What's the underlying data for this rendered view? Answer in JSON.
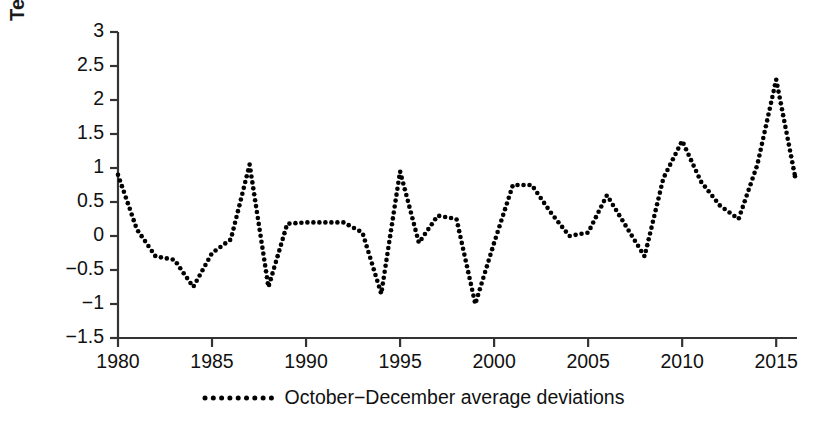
{
  "chart_data": {
    "type": "line",
    "style": "dotted",
    "title": "",
    "xlabel": "",
    "ylabel": "Temperature (°F)",
    "xlim": [
      1980,
      2016
    ],
    "ylim": [
      -1.5,
      3
    ],
    "grid": false,
    "legend_position": "bottom-center",
    "x_ticks": [
      1980,
      1985,
      1990,
      1995,
      2000,
      2005,
      2010,
      2015
    ],
    "x_tick_labels": [
      "1980",
      "1985",
      "1990",
      "1995",
      "2000",
      "2005",
      "2010",
      "2015"
    ],
    "y_ticks": [
      3,
      2.5,
      2,
      1.5,
      1,
      0.5,
      0,
      -0.5,
      -1,
      -1.5
    ],
    "y_tick_labels": [
      "3",
      "2.5",
      "2",
      "1.5",
      "1",
      "0.5",
      "0",
      "−0.5",
      "−1",
      "−1.5"
    ],
    "series": [
      {
        "name": "October−December average deviations",
        "color": "#000000",
        "x": [
          1980,
          1981,
          1982,
          1983,
          1984,
          1985,
          1986,
          1987,
          1988,
          1989,
          1990,
          1991,
          1992,
          1993,
          1994,
          1995,
          1996,
          1997,
          1998,
          1999,
          2000,
          2001,
          2002,
          2003,
          2004,
          2005,
          2006,
          2007,
          2008,
          2009,
          2010,
          2011,
          2012,
          2013,
          2014,
          2015,
          2016
        ],
        "values": [
          0.9,
          0.1,
          -0.3,
          -0.35,
          -0.75,
          -0.25,
          -0.05,
          1.05,
          -0.75,
          0.18,
          0.2,
          0.2,
          0.2,
          0.05,
          -0.85,
          0.95,
          -0.1,
          0.3,
          0.25,
          -1.0,
          -0.1,
          0.75,
          0.75,
          0.35,
          0.0,
          0.05,
          0.6,
          0.15,
          -0.3,
          0.85,
          1.4,
          0.8,
          0.45,
          0.25,
          1.05,
          2.3,
          0.88
        ]
      }
    ]
  },
  "legend": {
    "entries": [
      {
        "label": "October−December average deviations",
        "marker": "dotted-line",
        "color": "#000000"
      }
    ]
  },
  "axes": {
    "y_axis_title": "Temperature (°F)"
  }
}
